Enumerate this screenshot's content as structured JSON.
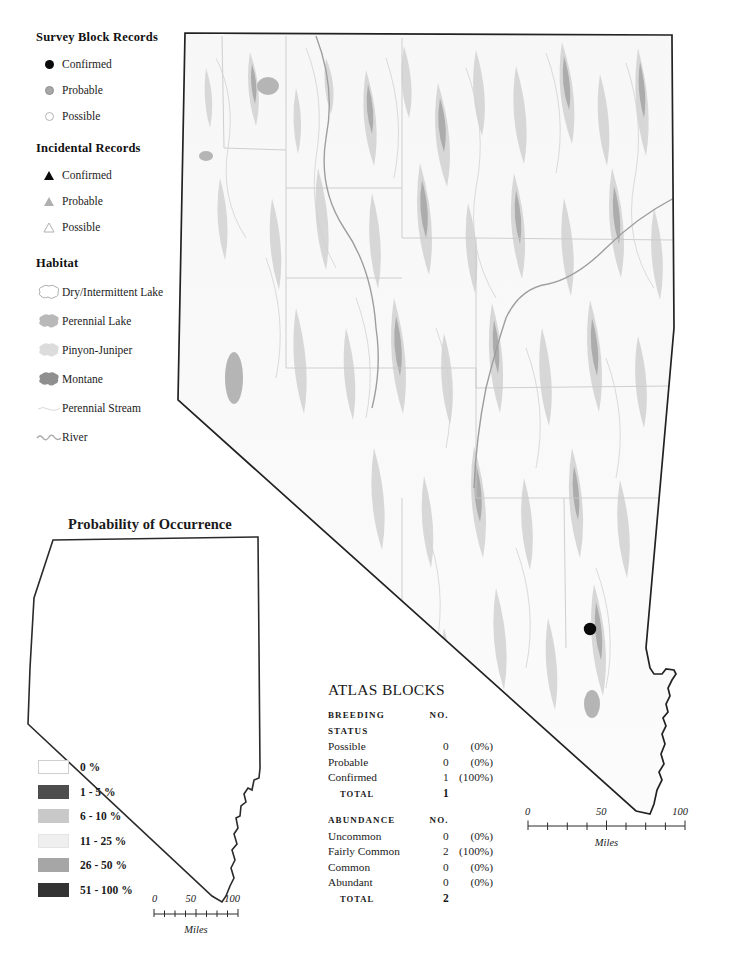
{
  "legend": {
    "survey_block": {
      "title": "Survey Block Records",
      "items": [
        {
          "label": "Confirmed",
          "symbol": "filled-circle-icon"
        },
        {
          "label": "Probable",
          "symbol": "gray-circle-icon"
        },
        {
          "label": "Possible",
          "symbol": "open-circle-icon"
        }
      ]
    },
    "incidental": {
      "title": "Incidental Records",
      "items": [
        {
          "label": "Confirmed",
          "symbol": "filled-triangle-icon"
        },
        {
          "label": "Probable",
          "symbol": "gray-triangle-icon"
        },
        {
          "label": "Possible",
          "symbol": "open-triangle-icon"
        }
      ]
    },
    "habitat": {
      "title": "Habitat",
      "items": [
        {
          "label": "Dry/Intermittent Lake",
          "symbol": "blob-outline-icon",
          "color": "#ffffff"
        },
        {
          "label": "Perennial Lake",
          "symbol": "blob-icon",
          "color": "#b9b9b9"
        },
        {
          "label": "Pinyon-Juniper",
          "symbol": "blob-icon",
          "color": "#dcdcdc"
        },
        {
          "label": "Montane",
          "symbol": "blob-icon",
          "color": "#8f8f8f"
        },
        {
          "label": "Perennial Stream",
          "symbol": "thin-line-icon",
          "color": "#d8d8d8"
        },
        {
          "label": "River",
          "symbol": "wavy-line-icon",
          "color": "#a9a9a9"
        }
      ]
    }
  },
  "probability": {
    "title": "Probability of Occurrence",
    "classes": [
      {
        "label": "0 %",
        "color": "#ffffff"
      },
      {
        "label": "1 - 5 %",
        "color": "#4d4d4d"
      },
      {
        "label": "6 - 10 %",
        "color": "#c9c9c9"
      },
      {
        "label": "11 - 25 %",
        "color": "#efefef"
      },
      {
        "label": "26 - 50 %",
        "color": "#a6a6a6"
      },
      {
        "label": "51 - 100 %",
        "color": "#333333"
      }
    ]
  },
  "scale_small": {
    "ticks": [
      "0",
      "50",
      "100"
    ],
    "unit": "Miles"
  },
  "scale_large": {
    "ticks": [
      "0",
      "50",
      "100"
    ],
    "unit": "Miles"
  },
  "atlas": {
    "title": "ATLAS BLOCKS",
    "breeding": {
      "header_label": "BREEDING STATUS",
      "header_no": "NO.",
      "rows": [
        {
          "label": "Possible",
          "no": "0",
          "pct": "(0%)"
        },
        {
          "label": "Probable",
          "no": "0",
          "pct": "(0%)"
        },
        {
          "label": "Confirmed",
          "no": "1",
          "pct": "(100%)"
        }
      ],
      "total_label": "TOTAL",
      "total_no": "1"
    },
    "abundance": {
      "header_label": "ABUNDANCE",
      "header_no": "NO.",
      "rows": [
        {
          "label": "Uncommon",
          "no": "0",
          "pct": "(0%)"
        },
        {
          "label": "Fairly Common",
          "no": "2",
          "pct": "(100%)"
        },
        {
          "label": "Common",
          "no": "0",
          "pct": "(0%)"
        },
        {
          "label": "Abundant",
          "no": "0",
          "pct": "(0%)"
        }
      ],
      "total_label": "TOTAL",
      "total_no": "2"
    }
  },
  "map": {
    "records": [
      {
        "type": "survey-block-confirmed",
        "x": 414,
        "y": 601
      }
    ],
    "colors": {
      "border": "#1a1a1a",
      "terrain_light": "#f2f2f2",
      "habitat_pinyon": "#d4d4d4",
      "habitat_montane": "#9d9d9d",
      "lake": "#b5b5b5",
      "stream": "#c9c9c9",
      "county": "#c3c3c3"
    }
  }
}
